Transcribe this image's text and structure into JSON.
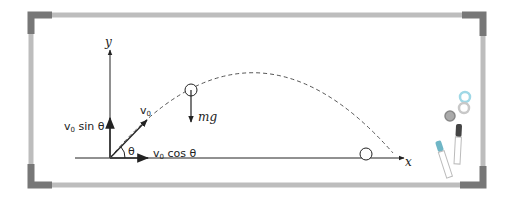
{
  "diagram": {
    "type": "projectile-motion-whiteboard",
    "labels": {
      "y_axis": "y",
      "x_axis": "x",
      "v0": "v",
      "v0_sub": "0",
      "v0_sin": "v",
      "v0_sin_sub": "0",
      "v0_sin_rest": " sin θ",
      "v0_cos": "v",
      "v0_cos_sub": "0",
      "v0_cos_rest": " cos θ",
      "theta": "θ",
      "weight": "mg"
    },
    "colors": {
      "frame": "#b8b8b8",
      "corner": "#7a7a7a",
      "board": "#ffffff",
      "ink": "#222222",
      "marker_blue": "#6fb6c6",
      "magnet_blue": "#9fd8e6",
      "magnet_gray": "#8c8c8c",
      "magnet_light": "#c8c8c8"
    }
  }
}
